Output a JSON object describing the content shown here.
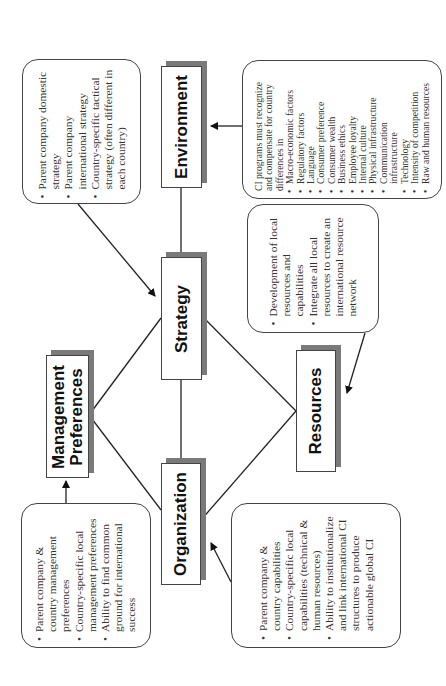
{
  "diagram": {
    "orientation": "rotated 90deg counter-clockwise",
    "nodes": {
      "environment": "Environment",
      "strategy": "Strategy",
      "management": "Management\nPreferences",
      "management_line1": "Management",
      "management_line2": "Preferences",
      "resources": "Resources",
      "organization": "Organization"
    },
    "callouts": {
      "strategy": {
        "items": [
          "Parent company domestic strategy",
          "Parent company international strategy",
          "Country-specific tactical strategy (often different in each country)"
        ]
      },
      "environment": {
        "intro": "CI programs must recognize and compensate for country differences in",
        "items": [
          "Macro-economic factors",
          "Regulatory factors",
          "Language",
          "Consumer preference",
          "Consumer wealth",
          "Business ethics",
          "Employee loyalty",
          "Internal culture",
          "Physical infrastructure",
          "Communication infrastructure",
          "Technology",
          "Intensity of competition",
          "Raw and human resources"
        ]
      },
      "resources": {
        "items": [
          "Development of local resources and capabilities",
          "Integrate all local resources to create an international resource network"
        ]
      },
      "management": {
        "items": [
          "Parent company & country management preferences",
          "Country-specific local management preferences",
          "Ability to find common ground for international success"
        ]
      },
      "organization": {
        "items": [
          "Parent company & country capabilities",
          "Country-specific local capabilities (technical & human resources)",
          "Ability to institutionalize and link international CI structures to produce actionable global CI"
        ]
      }
    },
    "connections": [
      {
        "from": "environment",
        "to": "strategy",
        "type": "line"
      },
      {
        "from": "strategy",
        "to": "organization",
        "type": "line"
      },
      {
        "from": "strategy",
        "to": "management",
        "type": "line"
      },
      {
        "from": "strategy",
        "to": "resources",
        "type": "line"
      },
      {
        "from": "management",
        "to": "organization",
        "type": "line"
      },
      {
        "from": "resources",
        "to": "organization",
        "type": "line"
      },
      {
        "from": "environment-callout",
        "to": "environment",
        "type": "arrow"
      },
      {
        "from": "strategy-callout",
        "to": "strategy",
        "type": "arrow"
      },
      {
        "from": "resources-callout",
        "to": "resources",
        "type": "arrow"
      },
      {
        "from": "management-callout",
        "to": "management",
        "type": "arrow"
      },
      {
        "from": "organization-callout",
        "to": "organization",
        "type": "arrow"
      }
    ]
  }
}
